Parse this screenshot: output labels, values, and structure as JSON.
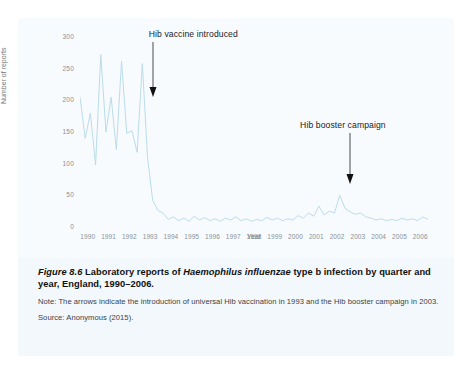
{
  "figure": {
    "number_label": "Figure 8.6",
    "caption_part1": "Laboratory reports of ",
    "caption_species": "Haemophilus influenzae",
    "caption_part2": " type b infection by quarter and year, England, 1990–2006.",
    "note": "Note: The arrows indicate the introduction of universal Hib vaccination in 1993 and the Hib booster campaign in 2003.",
    "source": "Source: Anonymous (2015)."
  },
  "annotations": {
    "vaccine": {
      "label": "Hib vaccine introduced",
      "arrow_name": "down-arrow-icon"
    },
    "booster": {
      "label": "Hib booster campaign",
      "arrow_name": "down-arrow-icon"
    }
  },
  "chart_data": {
    "type": "line",
    "title": "",
    "xlabel": "Year",
    "ylabel": "Number of reports",
    "ylim": [
      0,
      300
    ],
    "yticks": [
      0,
      50,
      100,
      150,
      200,
      250,
      300
    ],
    "xticks": [
      "1990",
      "1991",
      "1992",
      "1993",
      "1994",
      "1995",
      "1996",
      "1997",
      "1998",
      "1999",
      "2000",
      "2001",
      "2002",
      "2003",
      "2004",
      "2005",
      "2006"
    ],
    "grid": false,
    "legend": null,
    "line_color": "#bcdcea",
    "x_unit": "quarter",
    "x": [
      "1990 Q1",
      "1990 Q2",
      "1990 Q3",
      "1990 Q4",
      "1991 Q1",
      "1991 Q2",
      "1991 Q3",
      "1991 Q4",
      "1992 Q1",
      "1992 Q2",
      "1992 Q3",
      "1992 Q4",
      "1993 Q1",
      "1993 Q2",
      "1993 Q3",
      "1993 Q4",
      "1994 Q1",
      "1994 Q2",
      "1994 Q3",
      "1994 Q4",
      "1995 Q1",
      "1995 Q2",
      "1995 Q3",
      "1995 Q4",
      "1996 Q1",
      "1996 Q2",
      "1996 Q3",
      "1996 Q4",
      "1997 Q1",
      "1997 Q2",
      "1997 Q3",
      "1997 Q4",
      "1998 Q1",
      "1998 Q2",
      "1998 Q3",
      "1998 Q4",
      "1999 Q1",
      "1999 Q2",
      "1999 Q3",
      "1999 Q4",
      "2000 Q1",
      "2000 Q2",
      "2000 Q3",
      "2000 Q4",
      "2001 Q1",
      "2001 Q2",
      "2001 Q3",
      "2001 Q4",
      "2002 Q1",
      "2002 Q2",
      "2002 Q3",
      "2002 Q4",
      "2003 Q1",
      "2003 Q2",
      "2003 Q3",
      "2003 Q4",
      "2004 Q1",
      "2004 Q2",
      "2004 Q3",
      "2004 Q4",
      "2005 Q1",
      "2005 Q2",
      "2005 Q3",
      "2005 Q4",
      "2006 Q1",
      "2006 Q2",
      "2006 Q3",
      "2006 Q4"
    ],
    "values": [
      205,
      140,
      180,
      98,
      272,
      150,
      205,
      122,
      262,
      148,
      152,
      118,
      258,
      110,
      42,
      26,
      22,
      12,
      16,
      10,
      14,
      9,
      17,
      11,
      15,
      10,
      13,
      9,
      14,
      11,
      16,
      10,
      13,
      9,
      12,
      10,
      15,
      11,
      14,
      10,
      13,
      11,
      18,
      14,
      22,
      17,
      33,
      19,
      25,
      22,
      50,
      30,
      24,
      20,
      22,
      16,
      14,
      11,
      13,
      10,
      12,
      10,
      14,
      11,
      13,
      10,
      16,
      12
    ],
    "events": [
      {
        "label": "Hib vaccine introduced",
        "x": "1993 Q3",
        "value": 1993.5
      },
      {
        "label": "Hib booster campaign",
        "x": "2003 Q1",
        "value": 2003.0
      }
    ]
  }
}
